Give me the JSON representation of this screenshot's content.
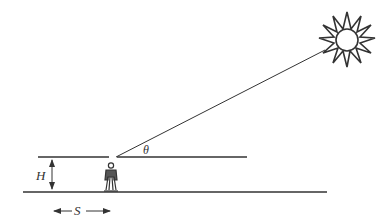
{
  "diagram": {
    "labels": {
      "height": "H",
      "distance": "S",
      "angle": "θ"
    },
    "colors": {
      "stroke": "#333333",
      "background": "#ffffff"
    },
    "elements": [
      "sun",
      "sun-ray",
      "roof-line",
      "horizontal-reference-line",
      "ground-line",
      "person",
      "height-arrow",
      "distance-arrow"
    ]
  }
}
